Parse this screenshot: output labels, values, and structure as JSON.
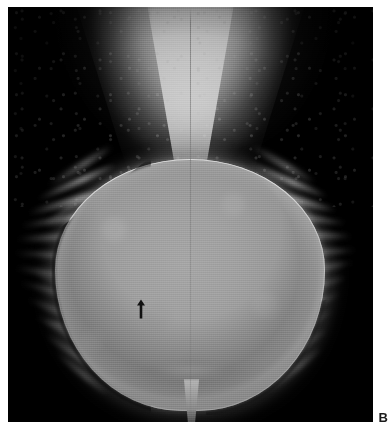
{
  "figure": {
    "panel_label": "B",
    "modality": "radiograph",
    "caption": ""
  },
  "radiograph": {
    "background_color": "#000000",
    "page_color": "#ffffff",
    "mass_fill_color": "#9a9a9a",
    "rim_color": "#e8e8e8",
    "dark_crescent_color": "#0a0a0a",
    "funnel_color": "#f8f8f8",
    "regions": [
      {
        "name": "superior-funnel",
        "label": ""
      },
      {
        "name": "central-mass",
        "label": ""
      },
      {
        "name": "left-lateral-wisps",
        "label": ""
      },
      {
        "name": "right-lateral-wisps",
        "label": ""
      },
      {
        "name": "inferior-tail",
        "label": ""
      }
    ]
  },
  "annotations": {
    "arrow": {
      "name": "arrow-marker",
      "direction": "up",
      "color": "#111111",
      "x": 141,
      "y": 308
    }
  },
  "wisps": {
    "left": [
      {
        "top": 6,
        "left": 34,
        "width": 76,
        "height": 7,
        "rotate": -32
      },
      {
        "top": 22,
        "left": 26,
        "width": 86,
        "height": 6,
        "rotate": -24
      },
      {
        "top": 40,
        "left": 18,
        "width": 96,
        "height": 7,
        "rotate": -16
      },
      {
        "top": 58,
        "left": 12,
        "width": 104,
        "height": 6,
        "rotate": -9
      },
      {
        "top": 76,
        "left": 8,
        "width": 110,
        "height": 7,
        "rotate": -3
      },
      {
        "top": 96,
        "left": 6,
        "width": 114,
        "height": 6,
        "rotate": 3
      },
      {
        "top": 116,
        "left": 6,
        "width": 112,
        "height": 7,
        "rotate": 9
      },
      {
        "top": 136,
        "left": 10,
        "width": 106,
        "height": 6,
        "rotate": 15
      },
      {
        "top": 156,
        "left": 16,
        "width": 98,
        "height": 7,
        "rotate": 21
      },
      {
        "top": 176,
        "left": 22,
        "width": 90,
        "height": 6,
        "rotate": 27
      },
      {
        "top": 196,
        "left": 30,
        "width": 80,
        "height": 6,
        "rotate": 33
      },
      {
        "top": 214,
        "left": 40,
        "width": 68,
        "height": 5,
        "rotate": 39
      },
      {
        "top": 50,
        "left": 30,
        "width": 60,
        "height": 4,
        "rotate": -34
      },
      {
        "top": 128,
        "left": 24,
        "width": 66,
        "height": 4,
        "rotate": 26
      },
      {
        "top": 168,
        "left": 34,
        "width": 58,
        "height": 4,
        "rotate": 12
      }
    ],
    "right": [
      {
        "top": 4,
        "left": 8,
        "width": 74,
        "height": 7,
        "rotate": 30
      },
      {
        "top": 20,
        "left": 6,
        "width": 86,
        "height": 6,
        "rotate": 23
      },
      {
        "top": 38,
        "left": 4,
        "width": 96,
        "height": 7,
        "rotate": 15
      },
      {
        "top": 56,
        "left": 2,
        "width": 106,
        "height": 6,
        "rotate": 8
      },
      {
        "top": 74,
        "left": 0,
        "width": 114,
        "height": 7,
        "rotate": 2
      },
      {
        "top": 94,
        "left": 0,
        "width": 118,
        "height": 6,
        "rotate": -4
      },
      {
        "top": 112,
        "left": 0,
        "width": 116,
        "height": 7,
        "rotate": -10
      },
      {
        "top": 132,
        "left": 2,
        "width": 110,
        "height": 6,
        "rotate": -16
      },
      {
        "top": 152,
        "left": 4,
        "width": 102,
        "height": 7,
        "rotate": -22
      },
      {
        "top": 172,
        "left": 8,
        "width": 92,
        "height": 6,
        "rotate": -28
      },
      {
        "top": 192,
        "left": 14,
        "width": 82,
        "height": 6,
        "rotate": -34
      },
      {
        "top": 210,
        "left": 22,
        "width": 70,
        "height": 5,
        "rotate": -40
      },
      {
        "top": 46,
        "left": 18,
        "width": 62,
        "height": 4,
        "rotate": 20
      },
      {
        "top": 124,
        "left": 16,
        "width": 70,
        "height": 4,
        "rotate": -14
      },
      {
        "top": 164,
        "left": 20,
        "width": 60,
        "height": 4,
        "rotate": -26
      }
    ]
  }
}
